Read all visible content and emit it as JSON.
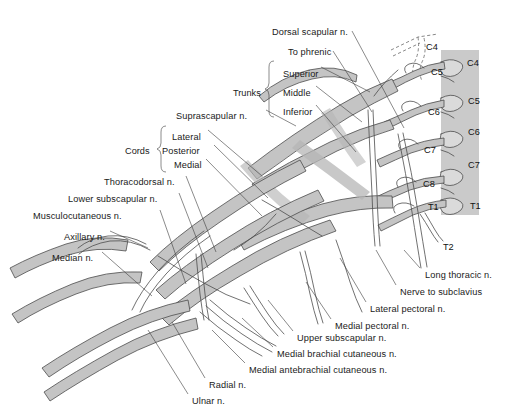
{
  "figure": {
    "kind": "anatomical-illustration",
    "colors": {
      "background": "#ffffff",
      "nerve_fill": "#c3c3c3",
      "nerve_fill_light": "#d5d5d5",
      "outline": "#4a4a4a",
      "vertebra_band": "#c9c9c9",
      "text": "#1a1a1a",
      "leader_line": "#3c3c3c"
    }
  },
  "group_labels": [
    {
      "name": "trunks",
      "text": "Trunks",
      "x": 233,
      "y": 89
    },
    {
      "name": "cords",
      "text": "Cords",
      "x": 125,
      "y": 147
    }
  ],
  "trunk_items": [
    {
      "name": "superior",
      "text": "Superior",
      "x": 283,
      "y": 70
    },
    {
      "name": "middle",
      "text": "Middle",
      "x": 283,
      "y": 89
    },
    {
      "name": "inferior",
      "text": "Inferior",
      "x": 283,
      "y": 108
    }
  ],
  "cord_items": [
    {
      "name": "lateral",
      "text": "Lateral",
      "x": 172,
      "y": 133
    },
    {
      "name": "posterior",
      "text": "Posterior",
      "x": 162,
      "y": 147
    },
    {
      "name": "medial",
      "text": "Medial",
      "x": 174,
      "y": 161
    }
  ],
  "labels_top": [
    {
      "name": "dorsal-scapular-n",
      "text": "Dorsal scapular n.",
      "x": 272,
      "y": 28
    },
    {
      "name": "to-phrenic",
      "text": "To phrenic",
      "x": 288,
      "y": 48
    }
  ],
  "labels_left": [
    {
      "name": "suprascapular-n",
      "text": "Suprascapular n.",
      "x": 176,
      "y": 112
    },
    {
      "name": "thoracodorsal-n",
      "text": "Thoracodorsal n.",
      "x": 104,
      "y": 178
    },
    {
      "name": "lower-subscapular-n",
      "text": "Lower subscapular n.",
      "x": 68,
      "y": 195
    },
    {
      "name": "musculocutaneous-n",
      "text": "Musculocutaneous n.",
      "x": 33,
      "y": 212
    },
    {
      "name": "axillary-n",
      "text": "Axillary n.",
      "x": 64,
      "y": 233
    },
    {
      "name": "median-n",
      "text": "Median n.",
      "x": 52,
      "y": 254
    }
  ],
  "labels_bottom": [
    {
      "name": "long-thoracic-n",
      "text": "Long thoracic n.",
      "x": 425,
      "y": 271
    },
    {
      "name": "nerve-to-subclavius",
      "text": "Nerve to subclavius",
      "x": 400,
      "y": 288
    },
    {
      "name": "lateral-pectoral-n",
      "text": "Lateral pectoral n.",
      "x": 370,
      "y": 305
    },
    {
      "name": "medial-pectoral-n",
      "text": "Medial pectoral n.",
      "x": 335,
      "y": 322
    },
    {
      "name": "upper-subscapular-n",
      "text": "Upper subscapular n.",
      "x": 297,
      "y": 334
    },
    {
      "name": "medial-brachial-cutaneous-n",
      "text": "Medial brachial cutaneous n.",
      "x": 277,
      "y": 350
    },
    {
      "name": "medial-antebrachial-cutaneous-n",
      "text": "Medial antebrachial cutaneous n.",
      "x": 249,
      "y": 366
    },
    {
      "name": "radial-n",
      "text": "Radial n.",
      "x": 209,
      "y": 381
    },
    {
      "name": "ulnar-n",
      "text": "Ulnar n.",
      "x": 192,
      "y": 397
    }
  ],
  "root_labels_inner": [
    {
      "name": "root-c4",
      "text": "C4",
      "x": 426,
      "y": 43
    },
    {
      "name": "root-c5",
      "text": "C5",
      "x": 431,
      "y": 68
    },
    {
      "name": "root-c6",
      "text": "C6",
      "x": 428,
      "y": 108
    },
    {
      "name": "root-c7",
      "text": "C7",
      "x": 424,
      "y": 146
    },
    {
      "name": "root-c8",
      "text": "C8",
      "x": 423,
      "y": 180
    },
    {
      "name": "root-t1",
      "text": "T1",
      "x": 428,
      "y": 203
    },
    {
      "name": "root-t2",
      "text": "T2",
      "x": 443,
      "y": 243
    }
  ],
  "vertebra_labels": [
    {
      "name": "vertebra-c4",
      "text": "C4",
      "x": 467,
      "y": 59
    },
    {
      "name": "vertebra-c5",
      "text": "C5",
      "x": 468,
      "y": 97
    },
    {
      "name": "vertebra-c6",
      "text": "C6",
      "x": 468,
      "y": 128
    },
    {
      "name": "vertebra-c7",
      "text": "C7",
      "x": 468,
      "y": 161
    },
    {
      "name": "vertebra-t1",
      "text": "T1",
      "x": 470,
      "y": 202
    }
  ]
}
